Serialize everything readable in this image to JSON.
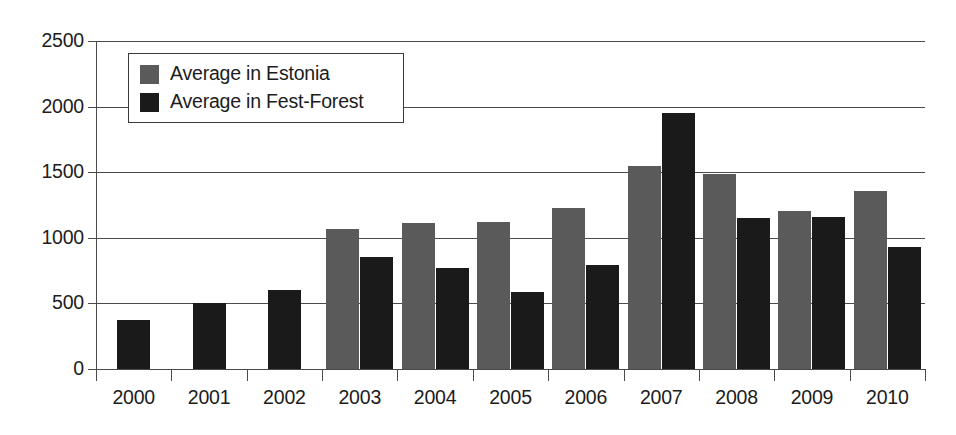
{
  "chart_data": {
    "type": "bar",
    "title": "",
    "subtitle": "",
    "xlabel": "",
    "ylabel": "",
    "ylim": [
      0,
      2500
    ],
    "ytick_values": [
      0,
      500,
      1000,
      1500,
      2000,
      2500
    ],
    "ytick_labels": [
      "0",
      "500",
      "1000",
      "1500",
      "2000",
      "2500"
    ],
    "grid": true,
    "legend_position": "top-left-inside",
    "categories": [
      "2000",
      "2001",
      "2002",
      "2003",
      "2004",
      "2005",
      "2006",
      "2007",
      "2008",
      "2009",
      "2010"
    ],
    "series": [
      {
        "name": "Average in Estonia",
        "color": "#5a5a5a",
        "values": [
          null,
          null,
          null,
          1065,
          1115,
          1120,
          1225,
          1545,
          1490,
          1205,
          1355
        ]
      },
      {
        "name": "Average in Fest-Forest",
        "color": "#1a1a1a",
        "values": [
          370,
          500,
          600,
          855,
          770,
          585,
          795,
          1950,
          1150,
          1160,
          930
        ]
      }
    ]
  },
  "legend": {
    "entries": [
      {
        "label": "Average in Estonia",
        "swatch": "legend-swatch-gray"
      },
      {
        "label": "Average in Fest-Forest",
        "swatch": "legend-swatch-black"
      }
    ]
  },
  "colors": {
    "series_estonia": "#5a5a5a",
    "series_fest_forest": "#1a1a1a",
    "axis": "#4a4a4a",
    "text": "#1c1c1c",
    "background": "#ffffff"
  }
}
